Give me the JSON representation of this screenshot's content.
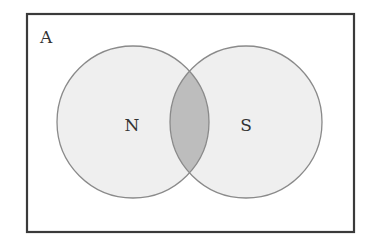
{
  "diagram": {
    "type": "venn",
    "universe": {
      "label": "A",
      "x": 27,
      "y": 14,
      "width": 327,
      "height": 218,
      "stroke": "#3a3a3a"
    },
    "sets": [
      {
        "label": "N",
        "cx": 133,
        "cy": 122,
        "r": 76,
        "fill": "#efefef",
        "stroke": "#8a8a8a"
      },
      {
        "label": "S",
        "cx": 246,
        "cy": 122,
        "r": 76,
        "fill": "#efefef",
        "stroke": "#8a8a8a"
      }
    ],
    "intersection": {
      "sets": [
        "N",
        "S"
      ],
      "fill": "#bdbdbd",
      "shaded": true
    }
  }
}
